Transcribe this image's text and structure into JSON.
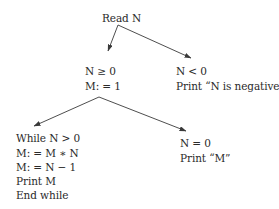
{
  "diagram": {
    "type": "flowchart-tree",
    "nodes": {
      "root": {
        "lines": [
          "Read N"
        ]
      },
      "nonneg": {
        "lines": [
          "N ≥ 0",
          "M: = 1"
        ]
      },
      "neg": {
        "lines": [
          "N < 0",
          "Print “N is negative”"
        ]
      },
      "loop": {
        "lines": [
          "While N > 0",
          "M: = M ∗ N",
          "M: = N − 1",
          "Print M",
          "End while"
        ]
      },
      "zero": {
        "lines": [
          "N = 0",
          "Print “M”"
        ]
      }
    },
    "edges": [
      {
        "from": "root",
        "to": "nonneg"
      },
      {
        "from": "root",
        "to": "neg"
      },
      {
        "from": "nonneg",
        "to": "loop"
      },
      {
        "from": "nonneg",
        "to": "zero"
      }
    ],
    "colors": {
      "line": "#3a3a3a",
      "text": "#2a2a2a",
      "background": "#ffffff"
    }
  }
}
